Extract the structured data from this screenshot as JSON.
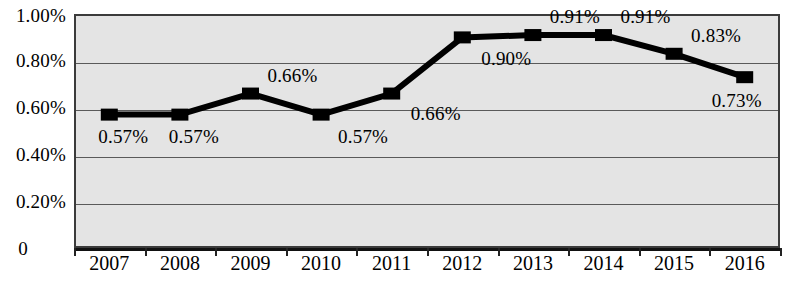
{
  "chart_data": {
    "type": "line",
    "title": "",
    "xlabel": "",
    "ylabel": "",
    "categories": [
      "2007",
      "2008",
      "2009",
      "2010",
      "2011",
      "2012",
      "2013",
      "2014",
      "2015",
      "2016"
    ],
    "values": [
      0.57,
      0.57,
      0.66,
      0.57,
      0.66,
      0.9,
      0.91,
      0.91,
      0.83,
      0.73
    ],
    "value_labels": [
      "0.57%",
      "0.57%",
      "0.66%",
      "0.57%",
      "0.66%",
      "0.90%",
      "0.91%",
      "0.91%",
      "0.83%",
      "0.73%"
    ],
    "ylim": [
      0,
      1.0
    ],
    "ytick_values": [
      1.0,
      0.8,
      0.6,
      0.4,
      0.2,
      0
    ],
    "ytick_labels": [
      "1.00%",
      "0.80%",
      "0.60%",
      "0.40%",
      "0.20%",
      "0"
    ],
    "grid": true,
    "legend": "none",
    "series_color": "#000000",
    "plot_background": "#e4e4e4",
    "marker": "square"
  },
  "label_offsets": [
    {
      "dx": 14,
      "dy": 22
    },
    {
      "dx": 14,
      "dy": 22
    },
    {
      "dx": 42,
      "dy": -18
    },
    {
      "dx": 42,
      "dy": 22
    },
    {
      "dx": 44,
      "dy": 20
    },
    {
      "dx": 44,
      "dy": 22
    },
    {
      "dx": 42,
      "dy": -18
    },
    {
      "dx": 42,
      "dy": -18
    },
    {
      "dx": 42,
      "dy": -18
    },
    {
      "dx": -8,
      "dy": 24
    }
  ]
}
